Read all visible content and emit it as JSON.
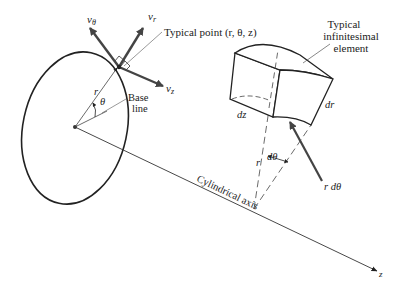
{
  "diagram": {
    "colors": {
      "line": "#222222",
      "thin_line": "#555555",
      "arrow": "#444444",
      "background": "#ffffff"
    },
    "left_figure": {
      "velocity_labels": {
        "v_theta": "v",
        "v_theta_sub": "θ",
        "v_r": "v",
        "v_r_sub": "r",
        "v_z": "v",
        "v_z_sub": "z"
      },
      "typical_point_label": "Typical point (r, θ, z)",
      "radius_label": "r",
      "angle_label": "θ",
      "base_line_label_1": "Base",
      "base_line_label_2": "line"
    },
    "right_figure": {
      "element_label_1": "Typical",
      "element_label_2": "infinitesimal",
      "element_label_3": "element",
      "dz_label": "dz",
      "dr_label": "dr",
      "r_label": "r",
      "dtheta_label": "dθ",
      "rdtheta_label": "r dθ"
    },
    "axis": {
      "label": "Cylindrical axis",
      "z_label": "z"
    }
  }
}
